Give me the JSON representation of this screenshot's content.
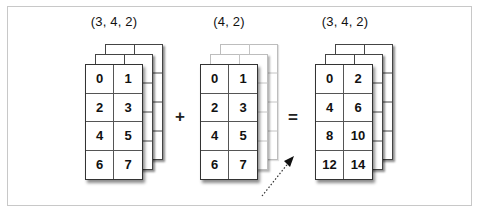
{
  "diagram": {
    "operands": [
      {
        "id": "left",
        "shape_label": "(3, 4, 2)",
        "layers": 3,
        "broadcast": false,
        "front_values": [
          [
            "0",
            "1"
          ],
          [
            "2",
            "3"
          ],
          [
            "4",
            "5"
          ],
          [
            "6",
            "7"
          ]
        ]
      },
      {
        "id": "middle",
        "shape_label": "(4, 2)",
        "layers": 3,
        "broadcast": true,
        "front_values": [
          [
            "0",
            "1"
          ],
          [
            "2",
            "3"
          ],
          [
            "4",
            "5"
          ],
          [
            "6",
            "7"
          ]
        ]
      },
      {
        "id": "result",
        "shape_label": "(3, 4, 2)",
        "layers": 3,
        "broadcast": false,
        "front_values": [
          [
            "0",
            "2"
          ],
          [
            "4",
            "6"
          ],
          [
            "8",
            "10"
          ],
          [
            "12",
            "14"
          ]
        ]
      }
    ],
    "operators": {
      "plus": "+",
      "equals": "="
    },
    "annotations": {
      "arrow_style": "dotted",
      "arrow_direction": "up-right"
    },
    "colors": {
      "frame_border": "#c8c8c8",
      "layer_border": "#444444",
      "broadcast_layer_border": "#bdbdbd",
      "text": "#111111"
    }
  }
}
